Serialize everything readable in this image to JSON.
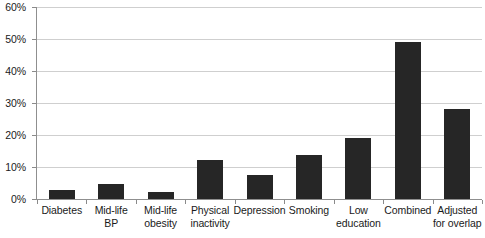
{
  "chart_data": {
    "type": "bar",
    "title": "",
    "subtitle": "",
    "xlabel": "",
    "ylabel": "",
    "ylim": [
      0,
      60
    ],
    "y_tick_labels": [
      "0%",
      "10%",
      "20%",
      "30%",
      "40%",
      "50%",
      "60%"
    ],
    "y_ticks": [
      0,
      10,
      20,
      30,
      40,
      50,
      60
    ],
    "y_unit": "%",
    "grid": true,
    "legend": false,
    "legend_position": "none",
    "bar_color": "#262626",
    "gridline_color": "#cfcfcf",
    "axis_color": "#8f8f8f",
    "categories": [
      "Diabetes",
      "Mid-life BP",
      "Mid-life obesity",
      "Physical inactivity",
      "Depression",
      "Smoking",
      "Low education",
      "Combined",
      "Adjusted for overlap"
    ],
    "category_lines": [
      [
        "Diabetes"
      ],
      [
        "Mid-life",
        "BP"
      ],
      [
        "Mid-life",
        "obesity"
      ],
      [
        "Physical",
        "inactivity"
      ],
      [
        "Depression"
      ],
      [
        "Smoking"
      ],
      [
        "Low",
        "education"
      ],
      [
        "Combined"
      ],
      [
        "Adjusted",
        "for overlap"
      ]
    ],
    "values": [
      2.8,
      4.7,
      2.2,
      12.3,
      7.6,
      13.6,
      19.0,
      49.0,
      28.0
    ],
    "annotations": []
  }
}
